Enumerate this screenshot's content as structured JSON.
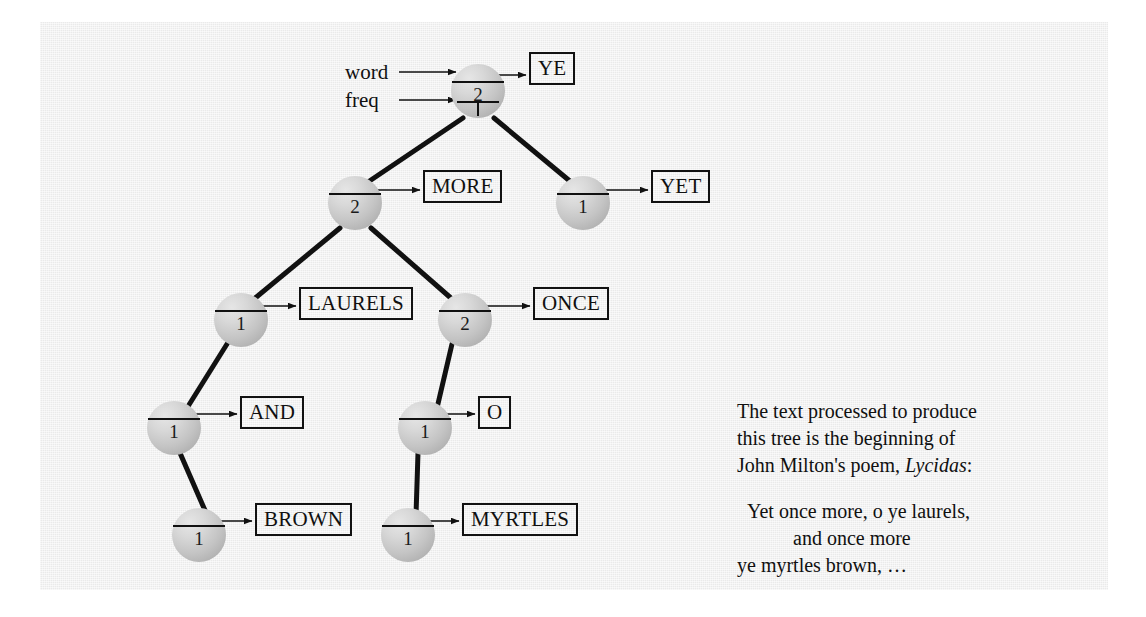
{
  "diagram": {
    "annotations": [
      {
        "name": "word-label",
        "text": "word"
      },
      {
        "name": "freq-label",
        "text": "freq"
      }
    ],
    "nodes": [
      {
        "id": "ye",
        "word": "YE",
        "freq": "2",
        "level": 0,
        "cx": 478,
        "cy": 91,
        "box_x": 529,
        "box_y": 52,
        "arrow_from_x": 478,
        "arrow_to_x": 526,
        "arrow_y": 75
      },
      {
        "id": "more",
        "word": "MORE",
        "freq": "2",
        "level": 1,
        "cx": 355,
        "cy": 203,
        "box_x": 423,
        "box_y": 170,
        "arrow_from_x": 355,
        "arrow_to_x": 420,
        "arrow_y": 190
      },
      {
        "id": "yet",
        "word": "YET",
        "freq": "1",
        "level": 1,
        "cx": 583,
        "cy": 203,
        "box_x": 651,
        "box_y": 170,
        "arrow_from_x": 583,
        "arrow_to_x": 648,
        "arrow_y": 190
      },
      {
        "id": "laurels",
        "word": "LAURELS",
        "freq": "1",
        "level": 2,
        "cx": 241,
        "cy": 320,
        "box_x": 299,
        "box_y": 287,
        "arrow_from_x": 241,
        "arrow_to_x": 296,
        "arrow_y": 306
      },
      {
        "id": "once",
        "word": "ONCE",
        "freq": "2",
        "level": 2,
        "cx": 465,
        "cy": 320,
        "box_x": 533,
        "box_y": 287,
        "arrow_from_x": 465,
        "arrow_to_x": 530,
        "arrow_y": 306
      },
      {
        "id": "and",
        "word": "AND",
        "freq": "1",
        "level": 3,
        "cx": 174,
        "cy": 428,
        "box_x": 240,
        "box_y": 396,
        "arrow_from_x": 174,
        "arrow_to_x": 237,
        "arrow_y": 414
      },
      {
        "id": "o",
        "word": "O",
        "freq": "1",
        "level": 3,
        "cx": 425,
        "cy": 428,
        "box_x": 478,
        "box_y": 396,
        "arrow_from_x": 425,
        "arrow_to_x": 475,
        "arrow_y": 414
      },
      {
        "id": "brown",
        "word": "BROWN",
        "freq": "1",
        "level": 4,
        "cx": 199,
        "cy": 535,
        "box_x": 255,
        "box_y": 503,
        "arrow_from_x": 199,
        "arrow_to_x": 252,
        "arrow_y": 521
      },
      {
        "id": "myrtles",
        "word": "MYRTLES",
        "freq": "1",
        "level": 4,
        "cx": 408,
        "cy": 535,
        "box_x": 462,
        "box_y": 503,
        "arrow_from_x": 408,
        "arrow_to_x": 459,
        "arrow_y": 521
      }
    ],
    "edges": [
      {
        "from": "ye",
        "to": "more",
        "x1": 463,
        "y1": 118,
        "x2": 368,
        "y2": 182
      },
      {
        "from": "ye",
        "to": "yet",
        "x1": 494,
        "y1": 118,
        "x2": 571,
        "y2": 182
      },
      {
        "from": "more",
        "to": "laurels",
        "x1": 340,
        "y1": 228,
        "x2": 254,
        "y2": 299
      },
      {
        "from": "more",
        "to": "once",
        "x1": 371,
        "y1": 228,
        "x2": 452,
        "y2": 299
      },
      {
        "from": "laurels",
        "to": "and",
        "x1": 227,
        "y1": 344,
        "x2": 187,
        "y2": 408
      },
      {
        "from": "once",
        "to": "o",
        "x1": 452,
        "y1": 344,
        "x2": 437,
        "y2": 408
      },
      {
        "from": "and",
        "to": "brown",
        "x1": 180,
        "y1": 453,
        "x2": 207,
        "y2": 515
      },
      {
        "from": "o",
        "to": "myrtles",
        "x1": 418,
        "y1": 453,
        "x2": 416,
        "y2": 515
      }
    ],
    "annotation_arrows": [
      {
        "name": "word-annotation-arrow",
        "x1": 399,
        "y1": 72,
        "x2": 456,
        "y2": 72
      },
      {
        "name": "freq-annotation-arrow",
        "x1": 399,
        "y1": 100,
        "x2": 456,
        "y2": 100
      }
    ],
    "word_label_pos": {
      "x": 345,
      "y": 60
    },
    "freq_label_pos": {
      "x": 345,
      "y": 88
    }
  },
  "caption": {
    "paragraph_lines": [
      "The text processed to produce",
      "this tree is the beginning of"
    ],
    "attribution_prefix": "John Milton's poem, ",
    "attribution_title": "Lycidas",
    "attribution_suffix": ":",
    "poem_lines": [
      "Yet once more, o ye laurels,",
      "and once more",
      "ye myrtles brown, …"
    ]
  },
  "colors": {
    "page_background": "#ffffff",
    "canvas_background": "#eaeaea",
    "ink": "#101010",
    "node_fill_light": "#e6e6e6",
    "node_fill_dark": "#a6a6a6"
  }
}
